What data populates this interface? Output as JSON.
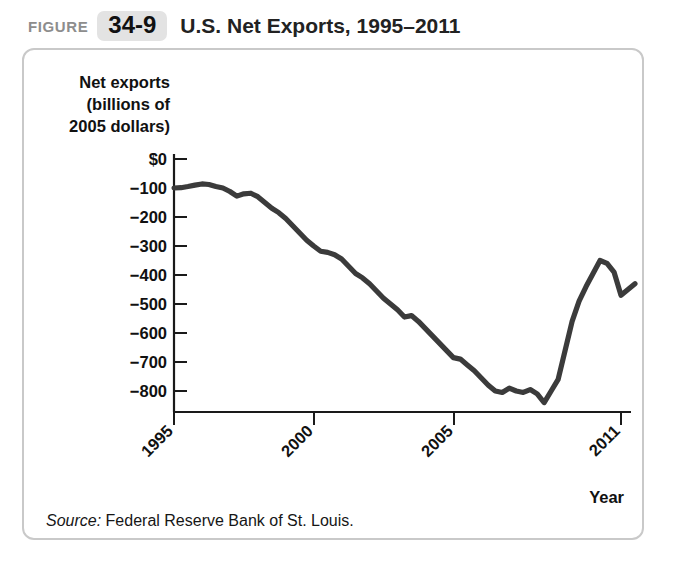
{
  "figure": {
    "kicker": "FIGURE",
    "number": "34-9",
    "title": "U.S. Net Exports, 1995–2011",
    "source_label": "Source:",
    "source_text": "Federal Reserve Bank of St. Louis."
  },
  "chart_data": {
    "type": "line",
    "title": "U.S. Net Exports, 1995–2011",
    "xlabel": "Year",
    "ylabel": "Net exports (billions of 2005 dollars)",
    "ylabel_lines": [
      "Net exports",
      "(billions of",
      "2005 dollars)"
    ],
    "xlim": [
      1995,
      2011.75
    ],
    "ylim": [
      -870,
      0
    ],
    "grid": false,
    "legend": null,
    "line_color": "#3b3b3b",
    "ytick_labels": [
      "$0",
      "−100",
      "−200",
      "−300",
      "−400",
      "−500",
      "−600",
      "−700",
      "−800"
    ],
    "ytick_values": [
      0,
      -100,
      -200,
      -300,
      -400,
      -500,
      -600,
      -700,
      -800
    ],
    "xtick_labels": [
      "1995",
      "2000",
      "2005",
      "2011"
    ],
    "xtick_values": [
      1995,
      2000,
      2005,
      2011
    ],
    "series": [
      {
        "name": "U.S. net exports",
        "units": "billions of 2005 dollars",
        "x": [
          1995.0,
          1995.25,
          1995.5,
          1995.75,
          1996.0,
          1996.25,
          1996.5,
          1996.75,
          1997.0,
          1997.25,
          1997.5,
          1997.75,
          1998.0,
          1998.25,
          1998.5,
          1998.75,
          1999.0,
          1999.25,
          1999.5,
          1999.75,
          2000.0,
          2000.25,
          2000.5,
          2000.75,
          2001.0,
          2001.25,
          2001.5,
          2001.75,
          2002.0,
          2002.25,
          2002.5,
          2002.75,
          2003.0,
          2003.25,
          2003.5,
          2003.75,
          2004.0,
          2004.25,
          2004.5,
          2004.75,
          2005.0,
          2005.25,
          2005.5,
          2005.75,
          2006.0,
          2006.25,
          2006.5,
          2006.75,
          2007.0,
          2007.25,
          2007.5,
          2007.75,
          2008.0,
          2008.25,
          2008.5,
          2008.75,
          2009.0,
          2009.25,
          2009.5,
          2009.75,
          2010.0,
          2010.25,
          2010.5,
          2010.75,
          2011.0,
          2011.25,
          2011.5
        ],
        "values": [
          -100,
          -99,
          -95,
          -90,
          -86,
          -88,
          -95,
          -100,
          -112,
          -128,
          -120,
          -118,
          -130,
          -150,
          -170,
          -185,
          -205,
          -230,
          -255,
          -280,
          -300,
          -318,
          -322,
          -330,
          -345,
          -370,
          -395,
          -410,
          -430,
          -455,
          -480,
          -500,
          -520,
          -545,
          -540,
          -560,
          -585,
          -610,
          -635,
          -660,
          -685,
          -690,
          -710,
          -730,
          -755,
          -780,
          -800,
          -805,
          -790,
          -800,
          -805,
          -795,
          -810,
          -840,
          -800,
          -760,
          -660,
          -560,
          -490,
          -440,
          -395,
          -350,
          -360,
          -390,
          -470,
          -450,
          -430
        ]
      }
    ],
    "annotations": [
      {
        "text": "peak (least negative) near 1996",
        "value": -86
      },
      {
        "text": "trough (most negative) near early 2008",
        "value": -840
      },
      {
        "text": "post-recession recovery peak near 2009-2010",
        "value": -350
      }
    ]
  }
}
